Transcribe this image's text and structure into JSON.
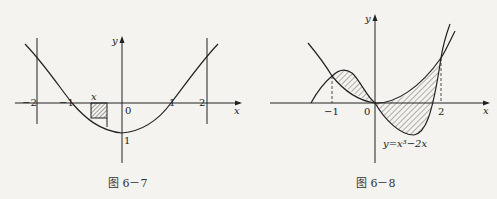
{
  "figures": [
    {
      "caption": "图 6－7",
      "axis_x_label": "x",
      "axis_y_label": "y",
      "ticks": {
        "neg2": "−2",
        "neg1": "−1",
        "zero": "0",
        "one": "1",
        "two": "2"
      },
      "y_intercept_label": "1",
      "strip_label": "x",
      "vertical_lines_at": [
        -2,
        2
      ],
      "description": "Upward-opening curve with vertex at (0,-1), crossing x-axis at ±1, bounded by vertical lines x=-2 and x=2, with a shaded rectangular strip between x-axis and curve near x≈-0.5"
    },
    {
      "caption": "图 6－8",
      "axis_x_label": "x",
      "axis_y_label": "y",
      "ticks": {
        "neg1": "−1",
        "zero": "0",
        "two": "2"
      },
      "curve_label": "y=x³−2x",
      "intersections_x": [
        -1,
        0,
        2
      ],
      "description": "Cubic y=x^3-2x and parabola-like curve y=x^2 intersecting at x=-1, 0, 2; regions between curves shaded with diagonal hatching; dashed verticals at x=-1 and x=2"
    }
  ],
  "colors": {
    "background": "#f4f3ef",
    "ink": "#222222",
    "hatch": "#444444"
  }
}
